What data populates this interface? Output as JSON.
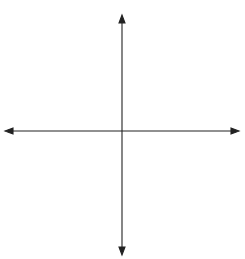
{
  "diagram": {
    "type": "coordinate-plane",
    "x_axis": {
      "label": "x",
      "min": -6,
      "max": 6,
      "tick_labels": [
        "−6",
        "−5",
        "−4",
        "−3",
        "−2",
        "1",
        "2",
        "3",
        "4",
        "5",
        "6"
      ]
    },
    "y_axis": {
      "label": "y",
      "min": -6,
      "max": 6,
      "tick_labels": [
        "6",
        "5",
        "4",
        "3",
        "2",
        "1",
        "−2",
        "−3",
        "−4",
        "−5",
        "−6"
      ]
    },
    "origin_label": "O",
    "colors": {
      "grid": "#a8a8a8",
      "axis": "#222222",
      "text": "#333333",
      "background": "#ffffff"
    }
  }
}
